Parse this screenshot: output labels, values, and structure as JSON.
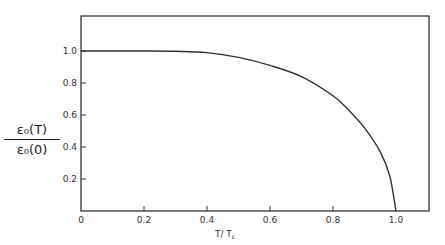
{
  "chart_data": {
    "type": "line",
    "title": "",
    "xlabel": "T / T_c",
    "ylabel": "ε0(T) / ε0(0)",
    "ylabel_numerator": "ε₀(T)",
    "ylabel_denominator": "ε₀(0)",
    "xlim": [
      0,
      1.08
    ],
    "ylim": [
      0,
      1.17
    ],
    "x_ticks": [
      0,
      0.2,
      0.4,
      0.6,
      0.8,
      1.0
    ],
    "x_tick_labels": [
      "0",
      "0.2",
      "0.4",
      "0.6",
      "0.8",
      "1.0"
    ],
    "y_ticks": [
      0.2,
      0.4,
      0.6,
      0.8,
      1.0
    ],
    "y_tick_labels": [
      "0.2",
      "0.4",
      "0.6",
      "0.8",
      "1.0"
    ],
    "grid": false,
    "legend": null,
    "series": [
      {
        "name": "gap ratio",
        "x": [
          0,
          0.1,
          0.2,
          0.3,
          0.4,
          0.5,
          0.6,
          0.7,
          0.8,
          0.85,
          0.9,
          0.95,
          0.98,
          1.0
        ],
        "y": [
          1.0,
          1.0,
          1.0,
          0.998,
          0.99,
          0.96,
          0.91,
          0.84,
          0.72,
          0.63,
          0.52,
          0.37,
          0.22,
          0.0
        ]
      }
    ]
  },
  "labels": {
    "xlabel_main": "T/ T",
    "xlabel_sub": "c",
    "ylabel_numerator": "ε₀(T)",
    "ylabel_denominator": "ε₀(0)"
  }
}
